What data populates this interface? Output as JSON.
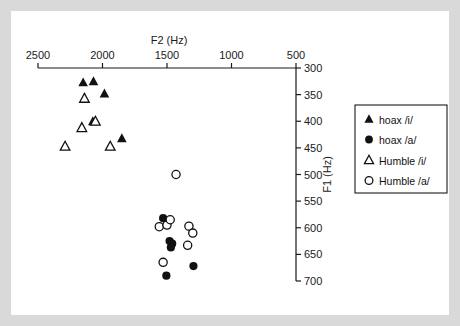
{
  "figure": {
    "frame_color": "#d9d9d9",
    "plate_color": "#ffffff"
  },
  "chart_data": {
    "type": "scatter",
    "title": "",
    "xlabel": "F2 (Hz)",
    "ylabel": "F1 (Hz)",
    "xlim": [
      2500,
      500
    ],
    "ylim": [
      300,
      700
    ],
    "x_axis_position": "top",
    "x_axis_reversed": true,
    "y_axis_position": "right",
    "y_axis_reversed": true,
    "grid": false,
    "legend_position": "right-outside",
    "xticks": [
      2500,
      2000,
      1500,
      1000,
      500
    ],
    "xtick_labels": [
      "2500",
      "2000",
      "1500",
      "1000",
      "500"
    ],
    "yticks": [
      300,
      350,
      400,
      450,
      500,
      550,
      600,
      650,
      700
    ],
    "ytick_labels": [
      "300",
      "350",
      "400",
      "450",
      "500",
      "550",
      "600",
      "650",
      "700"
    ],
    "series": [
      {
        "name": "hoax /i/",
        "marker": "filled-triangle",
        "color": "#111111",
        "points": [
          {
            "x": 2070,
            "y": 325
          },
          {
            "x": 1985,
            "y": 348
          },
          {
            "x": 2150,
            "y": 327
          },
          {
            "x": 2075,
            "y": 400
          },
          {
            "x": 1850,
            "y": 432
          }
        ]
      },
      {
        "name": "hoax /a/",
        "marker": "filled-circle",
        "color": "#111111",
        "points": [
          {
            "x": 1530,
            "y": 582
          },
          {
            "x": 1480,
            "y": 625
          },
          {
            "x": 1460,
            "y": 630
          },
          {
            "x": 1470,
            "y": 637
          },
          {
            "x": 1505,
            "y": 690
          },
          {
            "x": 1295,
            "y": 672
          }
        ]
      },
      {
        "name": "Humble /i/",
        "marker": "open-triangle",
        "color": "#111111",
        "points": [
          {
            "x": 2140,
            "y": 357
          },
          {
            "x": 2160,
            "y": 412
          },
          {
            "x": 2055,
            "y": 400
          },
          {
            "x": 2290,
            "y": 447
          },
          {
            "x": 1940,
            "y": 447
          }
        ]
      },
      {
        "name": "Humble /a/",
        "marker": "open-circle",
        "color": "#111111",
        "points": [
          {
            "x": 1430,
            "y": 500
          },
          {
            "x": 1560,
            "y": 598
          },
          {
            "x": 1500,
            "y": 595
          },
          {
            "x": 1475,
            "y": 585
          },
          {
            "x": 1330,
            "y": 597
          },
          {
            "x": 1300,
            "y": 610
          },
          {
            "x": 1340,
            "y": 633
          },
          {
            "x": 1530,
            "y": 665
          }
        ]
      }
    ]
  },
  "legend": {
    "entries": [
      {
        "label": "hoax /i/",
        "marker": "filled-triangle"
      },
      {
        "label": "hoax /a/",
        "marker": "filled-circle"
      },
      {
        "label": "Humble /i/",
        "marker": "open-triangle"
      },
      {
        "label": "Humble /a/",
        "marker": "open-circle"
      }
    ]
  }
}
